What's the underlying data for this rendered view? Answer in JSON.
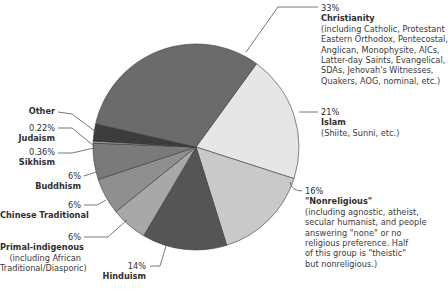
{
  "chart_data": {
    "type": "pie",
    "title": "",
    "unit": "%",
    "slices": [
      {
        "label": "Islam",
        "value": 21,
        "display": "21%",
        "description": "(Shiite, Sunni, etc.)",
        "color": "#e6e6e6"
      },
      {
        "label": "\"Nonreligious\"",
        "value": 16,
        "display": "16%",
        "description": "(including agnostic, atheist, secular humanist, and people answering \"none\" or no religious preference. Half of this group is \"theistic\" but nonreligious.)",
        "color": "#c9c9c9"
      },
      {
        "label": "Hinduism",
        "value": 14,
        "display": "14%",
        "description": "",
        "color": "#555555"
      },
      {
        "label": "Primal-indigenous",
        "value": 6,
        "display": "6%",
        "description": "(including African Traditional/Diasporic)",
        "color": "#a8a8a8"
      },
      {
        "label": "Chinese Traditional",
        "value": 6,
        "display": "6%",
        "description": "",
        "color": "#8f8f8f"
      },
      {
        "label": "Buddhism",
        "value": 6,
        "display": "6%",
        "description": "",
        "color": "#7a7a7a"
      },
      {
        "label": "Sikhism",
        "value": 0.36,
        "display": "0.36%",
        "description": "",
        "color": "#9a9a9a"
      },
      {
        "label": "Judaism",
        "value": 0.22,
        "display": "0.22%",
        "description": "",
        "color": "#1e1e1e"
      },
      {
        "label": "Other",
        "value": 2.6,
        "display": "",
        "description": "",
        "color": "#3c3c3c"
      },
      {
        "label": "Christianity",
        "value": 33,
        "display": "33%",
        "description": "(including Catholic, Protestant Eastern Orthodox, Pentecostal, Anglican, Monophysite, AICs, Latter-day Saints, Evangelical, SDAs, Jehovah's Witnesses, Quakers, AOG, nominal, etc.)",
        "color": "#6b6b6b"
      }
    ],
    "legend": "callout labels around pie"
  },
  "labels": {
    "christianity": {
      "pct": "33%",
      "name": "Christianity",
      "desc": [
        "(including Catholic, Protestant",
        "Eastern Orthodox, Pentecostal,",
        "Anglican, Monophysite, AICs,",
        "Latter-day Saints, Evangelical,",
        "SDAs, Jehovah's Witnesses,",
        "Quakers, AOG, nominal, etc.)"
      ]
    },
    "islam": {
      "pct": "21%",
      "name": "Islam",
      "desc": [
        "(Shiite, Sunni, etc.)"
      ]
    },
    "nonreligious": {
      "pct": "16%",
      "name": "\"Nonreligious\"",
      "desc": [
        "(including agnostic, atheist,",
        "secular humanist, and people",
        "answering \"none\" or no",
        "religious preference. Half",
        "of this group is \"theistic\"",
        "but nonreligious.)"
      ]
    },
    "hinduism": {
      "pct": "14%",
      "name": "Hinduism"
    },
    "primal": {
      "pct": "6%",
      "name": "Primal-indigenous",
      "desc": [
        "(including African",
        "Traditional/Diasporic)"
      ]
    },
    "chinese": {
      "pct": "6%",
      "name": "Chinese Traditional"
    },
    "buddhism": {
      "pct": "6%",
      "name": "Buddhism"
    },
    "sikhism": {
      "pct": "0.36%",
      "name": "Sikhism"
    },
    "judaism": {
      "pct": "0.22%",
      "name": "Judaism"
    },
    "other": {
      "name": "Other"
    }
  }
}
